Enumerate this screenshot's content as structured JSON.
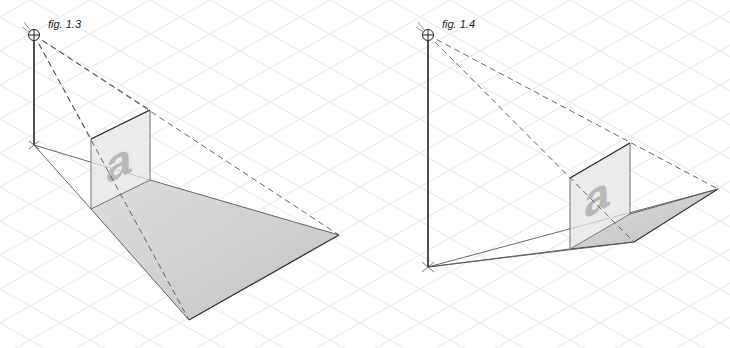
{
  "figures": [
    {
      "id": "fig-1-3",
      "caption": "fig. 1.3",
      "panel_letter": "a",
      "eye": [
        34,
        35
      ],
      "base": [
        34,
        145
      ],
      "panel": {
        "top_left": [
          91,
          139
        ],
        "top_right": [
          150,
          110
        ],
        "bottom_right": [
          150,
          180
        ],
        "bottom_left": [
          91,
          209
        ]
      },
      "shadow": {
        "near_left": [
          91,
          209
        ],
        "near_right": [
          150,
          180
        ],
        "far_right": [
          339,
          235
        ],
        "far_bottom": [
          189,
          320
        ]
      }
    },
    {
      "id": "fig-1-4",
      "caption": "fig. 1.4",
      "panel_letter": "a",
      "eye": [
        428,
        35
      ],
      "base": [
        428,
        267
      ],
      "panel": {
        "top_left": [
          570,
          178
        ],
        "top_right": [
          630,
          143
        ],
        "bottom_right": [
          630,
          214
        ],
        "bottom_left": [
          570,
          249
        ]
      },
      "shadow": {
        "near_left": [
          570,
          249
        ],
        "near_right": [
          630,
          214
        ],
        "far_right": [
          718,
          189
        ],
        "far_bottom": [
          634,
          242
        ]
      }
    }
  ],
  "colors": {
    "grid": "#ececec",
    "line": "#333333",
    "dash": "#555555",
    "panel_fill": "#e4e4e4",
    "shadow_fill": "#c4c4c4",
    "letter": "#b8b8b8"
  }
}
